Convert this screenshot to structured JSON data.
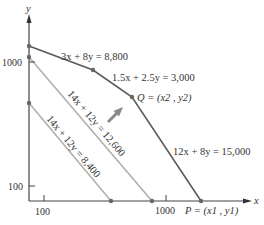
{
  "figure": {
    "axes": {
      "x_label": "x",
      "y_label": "y",
      "x_ticks": [
        {
          "label": "100"
        },
        {
          "label": "1000"
        }
      ],
      "y_ticks": [
        {
          "label": "100"
        },
        {
          "label": "1000"
        }
      ]
    },
    "constraints": [
      {
        "id": "c1",
        "label": "3x + 8y = 8,800"
      },
      {
        "id": "c2",
        "label": "1.5x + 2.5y = 3,000"
      },
      {
        "id": "c3",
        "label": "12x + 8y = 15,000"
      }
    ],
    "objective_lines": [
      {
        "id": "obj-high",
        "label": "14x + 12y = 12,600"
      },
      {
        "id": "obj-low",
        "label": "14x + 12y = 8,400"
      }
    ],
    "points": {
      "Q": "Q = (x2 , y2)",
      "P": "P = (x1 , y1)"
    },
    "colors": {
      "boundary": "#5a5a5a",
      "objective": "#b0b0b0",
      "axis": "#444444",
      "arrow": "#8a8a8a",
      "dot": "#666666"
    }
  }
}
